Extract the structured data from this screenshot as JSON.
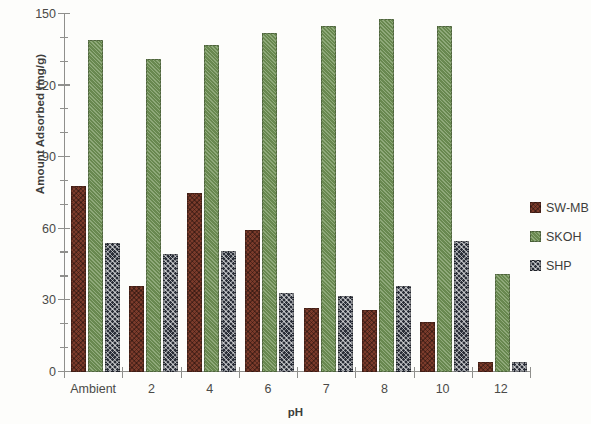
{
  "chart_data": {
    "type": "bar",
    "title": "",
    "xlabel": "pH",
    "ylabel": "Amount Adsorbed (mg/g)",
    "categories": [
      "Ambient",
      "2",
      "4",
      "6",
      "7",
      "8",
      "10",
      "12"
    ],
    "series": [
      {
        "name": "SW-MB",
        "color": "#7b3b2b",
        "values": [
          78,
          36,
          75,
          59.5,
          27,
          26,
          21,
          4
        ]
      },
      {
        "name": "SKOH",
        "color": "#6f9154",
        "values": [
          139,
          131,
          137,
          142,
          145,
          148,
          145,
          41
        ]
      },
      {
        "name": "SHP",
        "color": "#2a2e38",
        "values": [
          54,
          49.5,
          50.5,
          33,
          32,
          36,
          55,
          4
        ]
      }
    ],
    "ylim": [
      0,
      150
    ],
    "y_major_ticks": [
      0,
      30,
      60,
      90,
      120,
      150
    ],
    "y_minor_tick_interval": 10,
    "grid": false,
    "legend_position": "right"
  },
  "axis": {
    "y_tick_labels": [
      "0",
      "30",
      "60",
      "90",
      "120",
      "150"
    ],
    "y_title": "Amount Adsorbed (mg/g)",
    "x_title": "pH"
  }
}
